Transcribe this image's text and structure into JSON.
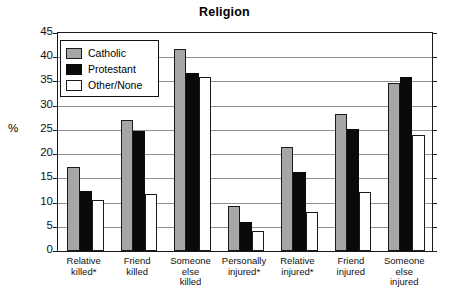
{
  "chart_data": {
    "type": "bar",
    "title": "Religion",
    "xlabel": "",
    "ylabel": "%",
    "ylim": [
      0,
      45
    ],
    "ytick_step": 5,
    "yticks": [
      45,
      40,
      35,
      30,
      25,
      20,
      15,
      10,
      5,
      0
    ],
    "grid": true,
    "legend_position": "top-left inside plot",
    "categories": [
      "Relative killed*",
      "Friend killed",
      "Someone else killed",
      "Personally injured*",
      "Relative injured*",
      "Friend injured",
      "Someone else injured"
    ],
    "category_lines": [
      [
        "Relative",
        "killed*"
      ],
      [
        "Friend",
        "killed"
      ],
      [
        "Someone",
        "else",
        "killed"
      ],
      [
        "Personally",
        "injured*"
      ],
      [
        "Relative",
        "injured*"
      ],
      [
        "Friend",
        "injured"
      ],
      [
        "Someone",
        "else",
        "injured"
      ]
    ],
    "series": [
      {
        "name": "Catholic",
        "color": "#a6a6a6",
        "values": [
          17.4,
          27.0,
          41.8,
          9.3,
          21.4,
          28.3,
          34.6
        ]
      },
      {
        "name": "Protestant",
        "color": "#0a0a0a",
        "values": [
          12.4,
          24.8,
          36.8,
          6.0,
          16.3,
          25.1,
          36.0
        ]
      },
      {
        "name": "Other/None",
        "color": "#ffffff",
        "values": [
          10.5,
          11.7,
          36.0,
          4.2,
          8.1,
          12.1,
          23.9
        ]
      }
    ]
  },
  "legend": {
    "items": [
      {
        "label": "Catholic",
        "swatch": "gray"
      },
      {
        "label": "Protestant",
        "swatch": "black"
      },
      {
        "label": "Other/None",
        "swatch": "white"
      }
    ]
  },
  "colors": {
    "catholic": "#a6a6a6",
    "protestant": "#0a0a0a",
    "other_none": "#ffffff",
    "axis": "#1a1a1a",
    "gridline": "#909090",
    "background": "#ffffff"
  }
}
